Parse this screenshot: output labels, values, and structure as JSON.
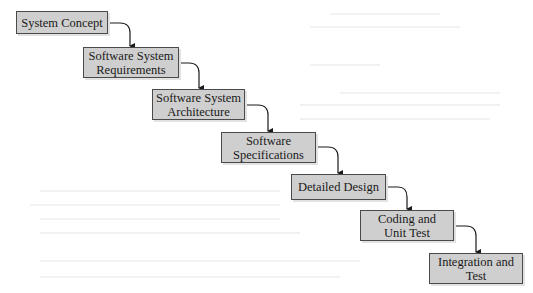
{
  "diagram": {
    "type": "waterfall",
    "colors": {
      "box_fill": "#cfcfcf",
      "box_border": "#4a4a4a",
      "arrow": "#1a1a1a",
      "background": "#ffffff"
    },
    "stages": [
      {
        "id": "s1",
        "label": "System Concept"
      },
      {
        "id": "s2",
        "label": "Software System\nRequirements"
      },
      {
        "id": "s3",
        "label": "Software System\nArchitecture"
      },
      {
        "id": "s4",
        "label": "Software\nSpecifications"
      },
      {
        "id": "s5",
        "label": "Detailed Design"
      },
      {
        "id": "s6",
        "label": "Coding and\nUnit Test"
      },
      {
        "id": "s7",
        "label": "Integration and\nTest"
      }
    ],
    "edges": [
      {
        "from": "s1",
        "to": "s2"
      },
      {
        "from": "s2",
        "to": "s3"
      },
      {
        "from": "s3",
        "to": "s4"
      },
      {
        "from": "s4",
        "to": "s5"
      },
      {
        "from": "s5",
        "to": "s6"
      },
      {
        "from": "s6",
        "to": "s7"
      }
    ]
  }
}
